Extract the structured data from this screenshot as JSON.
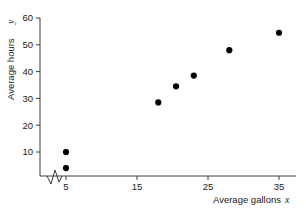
{
  "chart_data": {
    "type": "scatter",
    "title": "",
    "xlabel": "Average gallons",
    "xlabel_variable": "x",
    "ylabel": "Average hours",
    "ylabel_variable": "y",
    "xlim": [
      3.5,
      37
    ],
    "ylim": [
      0,
      61
    ],
    "xticks": [
      5,
      15,
      25,
      35
    ],
    "xtick_labels": [
      "5",
      "15",
      "25",
      "35"
    ],
    "yticks": [
      10,
      20,
      30,
      40,
      50,
      60
    ],
    "ytick_labels": [
      "10",
      "20",
      "30",
      "40",
      "50",
      "60"
    ],
    "grid": false,
    "legend": null,
    "axis_break": {
      "axis": "x",
      "symbol": "zigzag",
      "position_between": [
        3.9,
        4.8
      ]
    },
    "points": [
      {
        "x": 5,
        "y": 4
      },
      {
        "x": 5,
        "y": 10
      },
      {
        "x": 18,
        "y": 28.5
      },
      {
        "x": 20.5,
        "y": 34.5
      },
      {
        "x": 23,
        "y": 38.5
      },
      {
        "x": 28,
        "y": 48
      },
      {
        "x": 35,
        "y": 54.5
      }
    ],
    "marker": {
      "shape": "circle",
      "color": "#000000",
      "size_px": 3.1
    },
    "axis_color": "#3c3c3c"
  },
  "geometry": {
    "x_axis_y_px": 176,
    "y_axis_x_px": 40,
    "x_px_at_5": 66,
    "x_px_per_unit": 7.1,
    "y_px_at_10": 152,
    "y_px_per_unit": 2.68,
    "tick_len_px": 4,
    "xlabel_x_px": 213,
    "xlabel_y_px": 202,
    "ylabel_x_px": 13,
    "ylabel_y_px": 95
  }
}
